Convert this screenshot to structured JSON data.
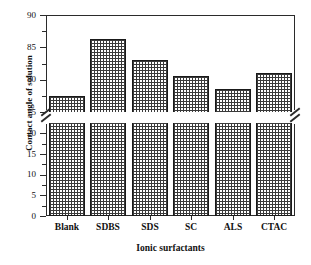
{
  "figure": {
    "top_truncated_text": "",
    "background_color": "#ffffff",
    "axis_color": "#2b2b2b",
    "bar_outline_color": "#1a1a1a",
    "bar_fill_color": "#3a3a3a"
  },
  "chart_data": {
    "type": "bar",
    "title": "",
    "xlabel": "Ionic surfactants",
    "ylabel": "Contact angle of solution",
    "categories": [
      "Blank",
      "SDBS",
      "SDS",
      "SC",
      "ALS",
      "CTAC"
    ],
    "values": [
      77.5,
      86.3,
      83.0,
      80.5,
      78.5,
      81.1
    ],
    "grid": false,
    "legend": "none",
    "axis_break": true,
    "ylim_lower": [
      0,
      22.5
    ],
    "ylim_upper": [
      75,
      90
    ],
    "ytick_labels_lower": [
      "0",
      "5",
      "10",
      "15",
      "20"
    ],
    "ytick_labels_upper": [
      "75",
      "80",
      "85",
      "90"
    ],
    "ytick_values_lower": [
      0,
      5,
      10,
      15,
      20
    ],
    "ytick_values_upper": [
      75,
      80,
      85,
      90
    ]
  }
}
